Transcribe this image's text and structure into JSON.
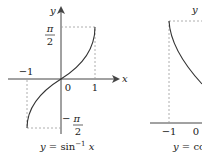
{
  "diagrams": [
    {
      "id": "arcsin",
      "caption": "y = sin⁻¹ x",
      "caption_parts": {
        "y": "y",
        "eq": " = sin",
        "sup": "−1",
        "x": " x"
      },
      "axis_labels": {
        "x": "x",
        "y": "y"
      },
      "tick_labels": {
        "neg_one": "−1",
        "zero": "0",
        "one": "1",
        "pi": "π",
        "two": "2",
        "neg_pi": "− π",
        "neg_two": "2"
      }
    },
    {
      "id": "arccos",
      "caption": "y = co",
      "caption_parts": {
        "y": "y",
        "eq": " = co"
      },
      "axis_labels": {
        "y": "y"
      },
      "tick_labels": {
        "neg_one": "−1",
        "zero": "0"
      }
    }
  ],
  "colors": {
    "curve": "#333333",
    "axis": "#444444",
    "dashed": "#999999"
  }
}
